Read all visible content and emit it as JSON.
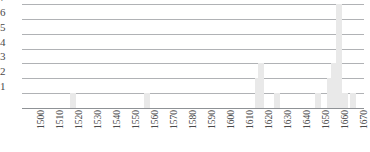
{
  "chart_data": {
    "type": "bar",
    "title": "",
    "subtitle": "",
    "xlabel": "",
    "ylabel": "",
    "grid": true,
    "legend": null,
    "xlim": [
      1495,
      1675
    ],
    "ylim": [
      0,
      7
    ],
    "yticks": [
      1,
      2,
      3,
      4,
      5,
      6,
      7
    ],
    "xticks": [
      1500,
      1510,
      1520,
      1530,
      1540,
      1550,
      1560,
      1570,
      1580,
      1590,
      1600,
      1610,
      1620,
      1630,
      1640,
      1650,
      1660,
      1670
    ],
    "xtick_labels": [
      "1500",
      "1510",
      "1520",
      "1530",
      "1540",
      "1550",
      "1560",
      "1570",
      "1580",
      "1590",
      "1600",
      "1610",
      "1620",
      "1630",
      "1640",
      "1650",
      "1660",
      "1670"
    ],
    "ytick_labels": [
      "1",
      "2",
      "3",
      "4",
      "5",
      "6",
      "7"
    ],
    "x": [
      1522,
      1561,
      1619,
      1621,
      1629,
      1651,
      1657,
      1659,
      1662,
      1665,
      1669
    ],
    "values": [
      1,
      1,
      2,
      3,
      1,
      1,
      2,
      3,
      7,
      1,
      1
    ],
    "bars": [
      {
        "x": 1522,
        "value": 1
      },
      {
        "x": 1561,
        "value": 1
      },
      {
        "x": 1619,
        "value": 2
      },
      {
        "x": 1621,
        "value": 3
      },
      {
        "x": 1629,
        "value": 1
      },
      {
        "x": 1651,
        "value": 1
      },
      {
        "x": 1657,
        "value": 2
      },
      {
        "x": 1659,
        "value": 3
      },
      {
        "x": 1662,
        "value": 7
      },
      {
        "x": 1665,
        "value": 1
      },
      {
        "x": 1669,
        "value": 1
      }
    ],
    "colors": {
      "bar": "#e9e9e9",
      "gridline": "#8f9296",
      "axis_text": "#4a4a4a",
      "background": "#ffffff"
    }
  }
}
